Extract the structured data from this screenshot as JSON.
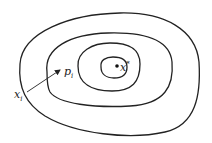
{
  "figure": {
    "stroke_color": "#222222",
    "background": "#ffffff"
  },
  "contours": [
    {
      "name": "outer",
      "left": 14,
      "right": 200,
      "top": 13,
      "bottom": 135
    },
    {
      "name": "second",
      "left": 45,
      "right": 172,
      "top": 33,
      "bottom": 107
    },
    {
      "name": "third",
      "left": 77,
      "right": 140,
      "top": 43,
      "bottom": 91
    },
    {
      "name": "inner",
      "left": 100,
      "right": 127,
      "top": 57,
      "bottom": 78
    }
  ],
  "points": {
    "minimizer": {
      "x": 117,
      "y": 66,
      "label_base": "x",
      "label_sup": "*"
    },
    "iterate": {
      "x": 27,
      "y": 92,
      "label_base": "x",
      "label_sub": "i"
    }
  },
  "arrow": {
    "from": [
      27,
      92
    ],
    "to": [
      60,
      70
    ],
    "label_base": "p",
    "label_sub": "i"
  }
}
